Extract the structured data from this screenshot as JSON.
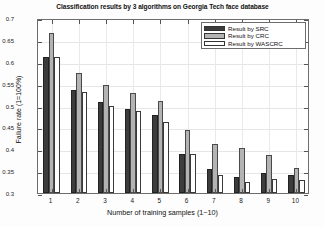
{
  "chart_data": {
    "type": "bar",
    "title": "Classification results by 3 algorithms on Georgia Tech face database",
    "xlabel": "Number of training samples (1−10)",
    "ylabel": "Failure rate (1=100%)",
    "categories": [
      "1",
      "2",
      "3",
      "4",
      "5",
      "6",
      "7",
      "8",
      "9",
      "10"
    ],
    "series": [
      {
        "name": "Result by SRC",
        "color": "#3c3c3c",
        "values": [
          0.61,
          0.535,
          0.508,
          0.492,
          0.478,
          0.39,
          0.356,
          0.336,
          0.345,
          0.342
        ]
      },
      {
        "name": "Result by CRC",
        "color": "#b3b3b3",
        "values": [
          0.665,
          0.575,
          0.548,
          0.528,
          0.51,
          0.443,
          0.413,
          0.404,
          0.388,
          0.358
        ]
      },
      {
        "name": "Result by WASCRC",
        "color": "#ffffff",
        "values": [
          0.61,
          0.532,
          0.5,
          0.488,
          0.462,
          0.39,
          0.342,
          0.325,
          0.332,
          0.33
        ]
      }
    ],
    "ylim": [
      0.3,
      0.7
    ],
    "yticks": [
      0.3,
      0.35,
      0.4,
      0.45,
      0.5,
      0.55,
      0.6,
      0.65,
      0.7
    ],
    "ytick_labels": [
      "0.3",
      "0.35",
      "0.4",
      "0.45",
      "0.5",
      "0.55",
      "0.6",
      "0.65",
      "0.7"
    ],
    "grid": true,
    "legend_position": "top-right"
  },
  "legend": {
    "items": [
      {
        "label": "Result by SRC"
      },
      {
        "label": "Result by CRC"
      },
      {
        "label": "Result by WASCRC"
      }
    ]
  }
}
